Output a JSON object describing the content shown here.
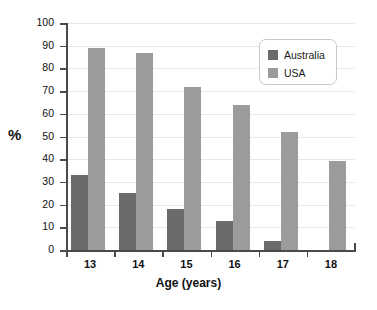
{
  "chart_data": {
    "type": "bar",
    "title": "",
    "xlabel": "Age (years)",
    "ylabel": "%",
    "categories": [
      "13",
      "14",
      "15",
      "16",
      "17",
      "18"
    ],
    "series": [
      {
        "name": "Australia",
        "color": "#6b6b6b",
        "values": [
          33,
          25,
          18,
          13,
          4,
          0
        ]
      },
      {
        "name": "USA",
        "color": "#9b9b9b",
        "values": [
          89,
          87,
          72,
          64,
          52,
          39
        ]
      }
    ],
    "ylim": [
      0,
      100
    ],
    "ytick_step": 10,
    "yticks": [
      0,
      10,
      20,
      30,
      40,
      50,
      60,
      70,
      80,
      90,
      100
    ],
    "grid": true,
    "legend_position": "top-right"
  },
  "legend": {
    "entries": [
      {
        "label": "Australia"
      },
      {
        "label": "USA"
      }
    ]
  },
  "axes": {
    "y_title": "%",
    "x_title": "Age (years)"
  }
}
